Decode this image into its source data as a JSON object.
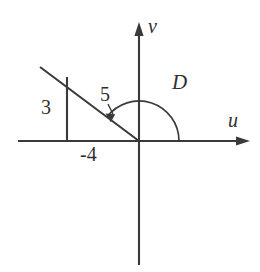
{
  "figure": {
    "axes": {
      "horizontal_label": "u",
      "vertical_label": "v",
      "origin": [
        139,
        141
      ]
    },
    "labels": {
      "angle": "D",
      "vertical_leg": "3",
      "hypotenuse": "5",
      "x_intercept": "-4"
    },
    "colors": {
      "stroke": "#3a3a3a",
      "text": "#2f2f2f",
      "background": "#ffffff"
    },
    "geometry": {
      "vector_tip": [
        40,
        67
      ],
      "right_angle_corner": [
        67,
        141
      ],
      "vertical_leg_top": [
        67,
        77
      ],
      "arc_radius": 40,
      "arc_start_deg": 0,
      "arc_end_deg": 143
    }
  }
}
